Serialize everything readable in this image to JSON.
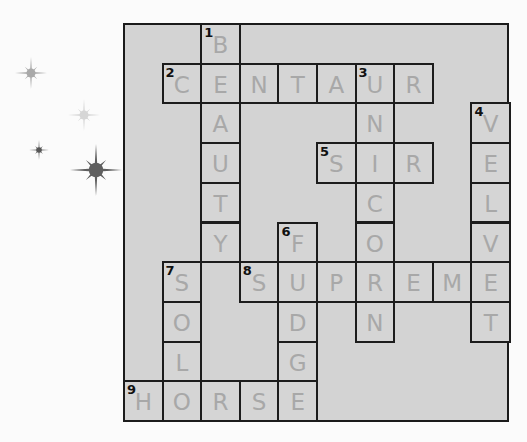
{
  "colors": {
    "grid_fill": "#d3d3d3",
    "cell_border": "#1c1c1c",
    "pencil_letters": "#a8a8a8",
    "star_medium": "#a9a9a9",
    "star_light": "#d6d6d6",
    "star_dark": "#5f5f5f"
  },
  "stars": [
    {
      "name": "star-medium",
      "cx": 31,
      "cy": 73,
      "r": 16,
      "color": "#a9a9a9"
    },
    {
      "name": "star-light",
      "cx": 84,
      "cy": 115,
      "r": 16,
      "color": "#d6d6d6"
    },
    {
      "name": "star-small-dark",
      "cx": 39,
      "cy": 150,
      "r": 10,
      "color": "#555555"
    },
    {
      "name": "star-large-dark",
      "cx": 96,
      "cy": 170,
      "r": 26,
      "color": "#5f5f5f"
    }
  ],
  "grid": {
    "cols": 10,
    "rows": 10,
    "cells": [
      {
        "r": 0,
        "c": 2,
        "letter": "B",
        "num": "1"
      },
      {
        "r": 1,
        "c": 1,
        "letter": "C",
        "num": "2"
      },
      {
        "r": 1,
        "c": 2,
        "letter": "E"
      },
      {
        "r": 1,
        "c": 3,
        "letter": "N"
      },
      {
        "r": 1,
        "c": 4,
        "letter": "T"
      },
      {
        "r": 1,
        "c": 5,
        "letter": "A"
      },
      {
        "r": 1,
        "c": 6,
        "letter": "U",
        "num": "3"
      },
      {
        "r": 1,
        "c": 7,
        "letter": "R"
      },
      {
        "r": 2,
        "c": 2,
        "letter": "A"
      },
      {
        "r": 2,
        "c": 6,
        "letter": "N"
      },
      {
        "r": 2,
        "c": 9,
        "letter": "V",
        "num": "4"
      },
      {
        "r": 3,
        "c": 2,
        "letter": "U"
      },
      {
        "r": 3,
        "c": 5,
        "letter": "S",
        "num": "5"
      },
      {
        "r": 3,
        "c": 6,
        "letter": "I"
      },
      {
        "r": 3,
        "c": 7,
        "letter": "R"
      },
      {
        "r": 3,
        "c": 9,
        "letter": "E"
      },
      {
        "r": 4,
        "c": 2,
        "letter": "T"
      },
      {
        "r": 4,
        "c": 6,
        "letter": "C"
      },
      {
        "r": 4,
        "c": 9,
        "letter": "L"
      },
      {
        "r": 5,
        "c": 2,
        "letter": "Y"
      },
      {
        "r": 5,
        "c": 4,
        "letter": "F",
        "num": "6"
      },
      {
        "r": 5,
        "c": 6,
        "letter": "O"
      },
      {
        "r": 5,
        "c": 9,
        "letter": "V"
      },
      {
        "r": 6,
        "c": 1,
        "letter": "S",
        "num": "7"
      },
      {
        "r": 6,
        "c": 3,
        "letter": "S",
        "num": "8"
      },
      {
        "r": 6,
        "c": 4,
        "letter": "U"
      },
      {
        "r": 6,
        "c": 5,
        "letter": "P"
      },
      {
        "r": 6,
        "c": 6,
        "letter": "R"
      },
      {
        "r": 6,
        "c": 7,
        "letter": "E"
      },
      {
        "r": 6,
        "c": 8,
        "letter": "M"
      },
      {
        "r": 6,
        "c": 9,
        "letter": "E"
      },
      {
        "r": 7,
        "c": 1,
        "letter": "O"
      },
      {
        "r": 7,
        "c": 4,
        "letter": "D"
      },
      {
        "r": 7,
        "c": 6,
        "letter": "N"
      },
      {
        "r": 7,
        "c": 9,
        "letter": "T"
      },
      {
        "r": 8,
        "c": 1,
        "letter": "L"
      },
      {
        "r": 8,
        "c": 4,
        "letter": "G"
      },
      {
        "r": 9,
        "c": 0,
        "letter": "H",
        "num": "9"
      },
      {
        "r": 9,
        "c": 1,
        "letter": "O"
      },
      {
        "r": 9,
        "c": 2,
        "letter": "R"
      },
      {
        "r": 9,
        "c": 3,
        "letter": "S"
      },
      {
        "r": 9,
        "c": 4,
        "letter": "E"
      }
    ]
  },
  "answers": {
    "across": [
      {
        "num": "2",
        "word": "CENTAUR"
      },
      {
        "num": "5",
        "word": "SIR"
      },
      {
        "num": "8",
        "word": "SUPREME"
      },
      {
        "num": "9",
        "word": "HORSE"
      }
    ],
    "down": [
      {
        "num": "1",
        "word": "BEAUTY"
      },
      {
        "num": "3",
        "word": "UNICORN"
      },
      {
        "num": "4",
        "word": "VELVET"
      },
      {
        "num": "6",
        "word": "FUDGE"
      },
      {
        "num": "7",
        "word": "SOLO"
      }
    ]
  }
}
